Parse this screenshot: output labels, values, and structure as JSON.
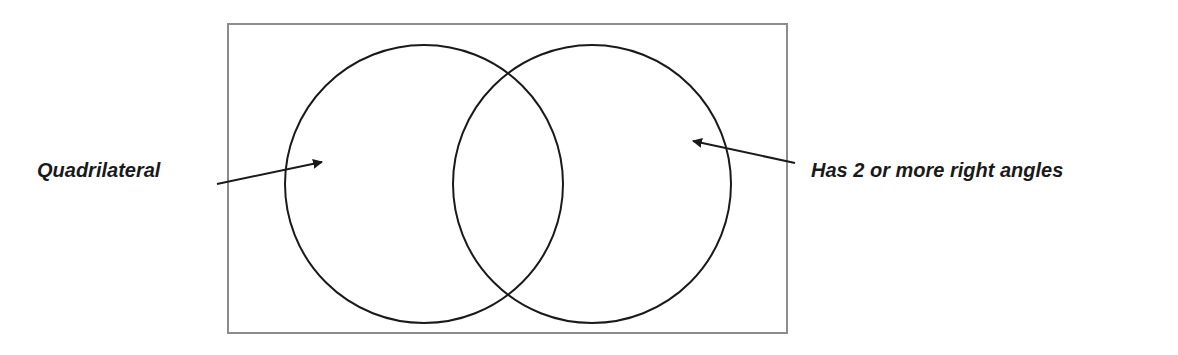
{
  "diagram": {
    "type": "venn",
    "sets": [
      {
        "id": "A",
        "label": "Quadrilateral"
      },
      {
        "id": "B",
        "label": "Has 2 or more right angles"
      }
    ],
    "colors": {
      "frame": "#8c8c8c",
      "circle": "#1a1a1a",
      "text": "#1a1a1a",
      "background": "#ffffff"
    }
  }
}
